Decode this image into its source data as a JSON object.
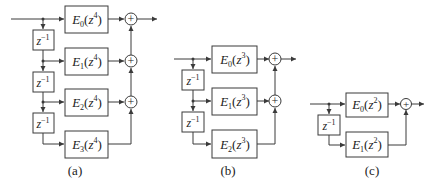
{
  "figure": {
    "panels": [
      {
        "caption": "(a)",
        "delay_label": "z",
        "delay_exp": "−1",
        "filters": [
          {
            "name": "E",
            "index": "0",
            "arg": "z",
            "power": "4"
          },
          {
            "name": "E",
            "index": "1",
            "arg": "z",
            "power": "4"
          },
          {
            "name": "E",
            "index": "2",
            "arg": "z",
            "power": "4"
          },
          {
            "name": "E",
            "index": "3",
            "arg": "z",
            "power": "4"
          }
        ],
        "sum_symbol": "+"
      },
      {
        "caption": "(b)",
        "delay_label": "z",
        "delay_exp": "−1",
        "filters": [
          {
            "name": "E",
            "index": "0",
            "arg": "z",
            "power": "3"
          },
          {
            "name": "E",
            "index": "1",
            "arg": "z",
            "power": "3"
          },
          {
            "name": "E",
            "index": "2",
            "arg": "z",
            "power": "3"
          }
        ],
        "sum_symbol": "+"
      },
      {
        "caption": "(c)",
        "delay_label": "z",
        "delay_exp": "−1",
        "filters": [
          {
            "name": "E",
            "index": "0",
            "arg": "z",
            "power": "2"
          },
          {
            "name": "E",
            "index": "1",
            "arg": "z",
            "power": "2"
          }
        ],
        "sum_symbol": "+"
      }
    ]
  }
}
